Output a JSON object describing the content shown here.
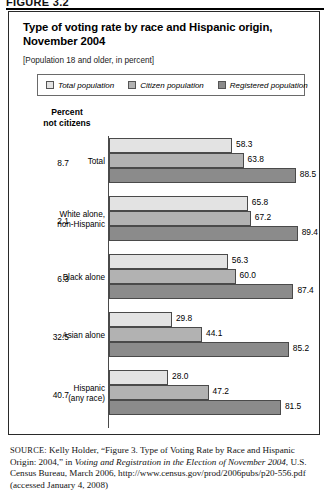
{
  "figure": {
    "label": "FIGURE 3.2",
    "title": "Type of voting rate by race and Hispanic origin, November 2004",
    "subtitle": "[Population 18 and older, in percent]",
    "pct_header_line1": "Percent",
    "pct_header_line2": "not citizens"
  },
  "legend": {
    "items": [
      {
        "label": "Total population",
        "color": "#e3e3e3",
        "swatch_name": "legend-swatch-total"
      },
      {
        "label": "Citizen population",
        "color": "#b2b2b2",
        "swatch_name": "legend-swatch-citizen"
      },
      {
        "label": "Registered population",
        "color": "#8b8b8b",
        "swatch_name": "legend-swatch-registered"
      }
    ]
  },
  "source": {
    "label": "SOURCE:",
    "text_part1": " Kelly Holder, “Figure 3. Type of Voting Rate by Race and Hispanic Origin: 2004,” in ",
    "italic_title": "Voting and Registration in the Election of November 2004",
    "text_part2": ", U.S. Census Bureau, March 2006, http://www.census.gov/prod/2006pubs/p20-556.pdf (accessed January 4, 2008)"
  },
  "chart_data": {
    "type": "bar",
    "orientation": "horizontal",
    "title": "Type of voting rate by race and Hispanic origin, November 2004",
    "subtitle": "[Population 18 and older, in percent]",
    "xlabel": "",
    "ylabel": "",
    "xlim": [
      0,
      100
    ],
    "grid": false,
    "legend_position": "top",
    "value_labels": true,
    "categories": [
      "Total",
      "White alone, non-Hispanic",
      "Black alone",
      "Asian alone",
      "Hispanic (any race)"
    ],
    "category_lines": [
      [
        "Total"
      ],
      [
        "White alone,",
        "non-Hispanic"
      ],
      [
        "Black alone"
      ],
      [
        "Asian alone"
      ],
      [
        "Hispanic",
        "(any race)"
      ]
    ],
    "series": [
      {
        "name": "Total population",
        "color": "#e3e3e3",
        "values": [
          58.3,
          65.8,
          56.3,
          29.8,
          28.0
        ]
      },
      {
        "name": "Citizen population",
        "color": "#b2b2b2",
        "values": [
          63.8,
          67.2,
          60.0,
          44.1,
          47.2
        ]
      },
      {
        "name": "Registered population",
        "color": "#8b8b8b",
        "values": [
          88.5,
          89.4,
          87.4,
          85.2,
          81.5
        ]
      }
    ],
    "annotation_column": {
      "header": "Percent not citizens",
      "values": [
        8.7,
        2.1,
        6.3,
        32.5,
        40.7
      ]
    }
  }
}
